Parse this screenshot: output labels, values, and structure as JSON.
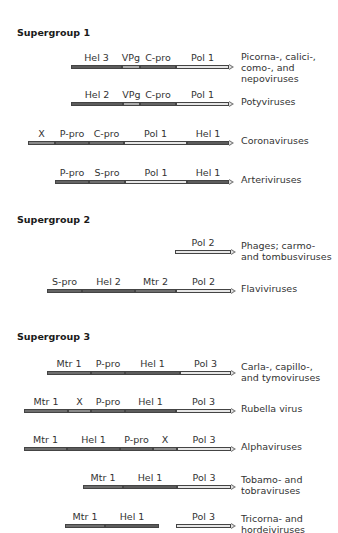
{
  "colors": {
    "hel": "#5c5c5c",
    "pro": "#646464",
    "vpg": "#ababab",
    "x": "#8a8a8a",
    "mtr": "#6e6e6e",
    "pol": "#e6e6e6"
  },
  "groups": [
    {
      "title": "Supergroup 1",
      "y": 27
    },
    {
      "title": "Supergroup 2",
      "y": 214
    },
    {
      "title": "Supergroup 3",
      "y": 331
    }
  ],
  "rows": [
    {
      "label": "Picorna-, calici-,\ncomo-, and\nnepoviruses",
      "bar_y": 65,
      "label_y": 51,
      "segments": [
        {
          "name": "Hel 3",
          "x0": 71,
          "x1": 122,
          "type": "hel"
        },
        {
          "name": "VPg",
          "x0": 122,
          "x1": 140,
          "type": "vpg"
        },
        {
          "name": "C-pro",
          "x0": 140,
          "x1": 176,
          "type": "pro"
        },
        {
          "name": "Pol 1",
          "x0": 176,
          "x1": 229,
          "type": "pol",
          "arrow": true
        }
      ]
    },
    {
      "label": "Potyviruses",
      "bar_y": 102,
      "label_y": 96,
      "segments": [
        {
          "name": "Hel 2",
          "x0": 71,
          "x1": 123,
          "type": "hel"
        },
        {
          "name": "VPg",
          "x0": 123,
          "x1": 140,
          "type": "vpg"
        },
        {
          "name": "C-pro",
          "x0": 140,
          "x1": 176,
          "type": "pro"
        },
        {
          "name": "Pol 1",
          "x0": 176,
          "x1": 229,
          "type": "pol",
          "arrow": true
        }
      ]
    },
    {
      "label": "Coronaviruses",
      "bar_y": 141,
      "label_y": 135,
      "segments": [
        {
          "name": "X",
          "x0": 28,
          "x1": 55,
          "type": "x"
        },
        {
          "name": "P-pro",
          "x0": 55,
          "x1": 89,
          "type": "pro"
        },
        {
          "name": "C-pro",
          "x0": 89,
          "x1": 124,
          "type": "mtr"
        },
        {
          "name": "Pol 1",
          "x0": 124,
          "x1": 187,
          "type": "pol"
        },
        {
          "name": "Hel 1",
          "x0": 187,
          "x1": 229,
          "type": "hel",
          "arrow": true
        }
      ]
    },
    {
      "label": "Arteriviruses",
      "bar_y": 180,
      "label_y": 174,
      "segments": [
        {
          "name": "P-pro",
          "x0": 55,
          "x1": 89,
          "type": "pro"
        },
        {
          "name": "S-pro",
          "x0": 89,
          "x1": 125,
          "type": "mtr"
        },
        {
          "name": "Pol 1",
          "x0": 125,
          "x1": 187,
          "type": "pol"
        },
        {
          "name": "Hel 1",
          "x0": 187,
          "x1": 229,
          "type": "hel",
          "arrow": true
        }
      ]
    },
    {
      "label": "Phages; carmo-\nand tombusviruses",
      "bar_y": 250,
      "label_y": 240,
      "segments": [
        {
          "name": "Pol 2",
          "x0": 175,
          "x1": 231,
          "type": "pol",
          "arrow": true
        }
      ]
    },
    {
      "label": "Flaviviruses",
      "bar_y": 289,
      "label_y": 283,
      "segments": [
        {
          "name": "S-pro",
          "x0": 47,
          "x1": 82,
          "type": "pro"
        },
        {
          "name": "Hel 2",
          "x0": 82,
          "x1": 135,
          "type": "hel"
        },
        {
          "name": "Mtr 2",
          "x0": 135,
          "x1": 176,
          "type": "mtr"
        },
        {
          "name": "Pol 2",
          "x0": 176,
          "x1": 231,
          "type": "pol",
          "arrow": true
        }
      ]
    },
    {
      "label": "Carla-, capillo-,\nand tymoviruses",
      "bar_y": 371,
      "label_y": 361,
      "segments": [
        {
          "name": "Mtr 1",
          "x0": 47,
          "x1": 91,
          "type": "mtr"
        },
        {
          "name": "P-pro",
          "x0": 91,
          "x1": 125,
          "type": "pro"
        },
        {
          "name": "Hel 1",
          "x0": 125,
          "x1": 180,
          "type": "hel"
        },
        {
          "name": "Pol 3",
          "x0": 180,
          "x1": 231,
          "type": "pol",
          "arrow": true
        }
      ]
    },
    {
      "label": "Rubella virus",
      "bar_y": 409,
      "label_y": 403,
      "segments": [
        {
          "name": "Mtr 1",
          "x0": 24,
          "x1": 68,
          "type": "mtr"
        },
        {
          "name": "X",
          "x0": 68,
          "x1": 91,
          "type": "x"
        },
        {
          "name": "P-pro",
          "x0": 91,
          "x1": 125,
          "type": "pro"
        },
        {
          "name": "Hel 1",
          "x0": 125,
          "x1": 176,
          "type": "hel"
        },
        {
          "name": "Pol 3",
          "x0": 176,
          "x1": 231,
          "type": "pol",
          "arrow": true
        }
      ]
    },
    {
      "label": "Alphaviruses",
      "bar_y": 447,
      "label_y": 441,
      "segments": [
        {
          "name": "Mtr 1",
          "x0": 24,
          "x1": 67,
          "type": "mtr"
        },
        {
          "name": "Hel 1",
          "x0": 67,
          "x1": 120,
          "type": "hel"
        },
        {
          "name": "P-pro",
          "x0": 120,
          "x1": 153,
          "type": "pro"
        },
        {
          "name": "X",
          "x0": 153,
          "x1": 177,
          "type": "x"
        },
        {
          "name": "Pol 3",
          "x0": 177,
          "x1": 231,
          "type": "pol",
          "arrow": true
        }
      ]
    },
    {
      "label": "Tobamo- and\ntobraviruses",
      "bar_y": 485,
      "label_y": 474,
      "segments": [
        {
          "name": "Mtr 1",
          "x0": 83,
          "x1": 123,
          "type": "mtr"
        },
        {
          "name": "Hel 1",
          "x0": 123,
          "x1": 177,
          "type": "hel"
        },
        {
          "name": "Pol 3",
          "x0": 177,
          "x1": 231,
          "type": "pol",
          "arrow": true
        }
      ]
    },
    {
      "label": "Tricorna- and\nhordeiviruses",
      "bar_y": 524,
      "label_y": 513,
      "segments": [
        {
          "name": "Mtr 1",
          "x0": 65,
          "x1": 105,
          "type": "mtr"
        },
        {
          "name": "Hel 1",
          "x0": 105,
          "x1": 159,
          "type": "hel"
        },
        {
          "name": "Pol 3",
          "x0": 176,
          "x1": 231,
          "type": "pol",
          "arrow": true
        }
      ]
    }
  ]
}
